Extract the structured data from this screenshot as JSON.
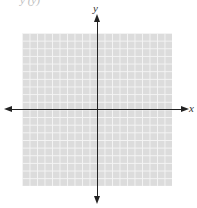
{
  "header": {
    "partial_text": "y (y)"
  },
  "graph": {
    "x_axis_label": "x",
    "y_axis_label": "y",
    "grid": {
      "columns": 20,
      "rows": 20,
      "fill_color": "#dcdcdc",
      "line_color": "#f4f4f4"
    },
    "axis_color": "#222222"
  }
}
